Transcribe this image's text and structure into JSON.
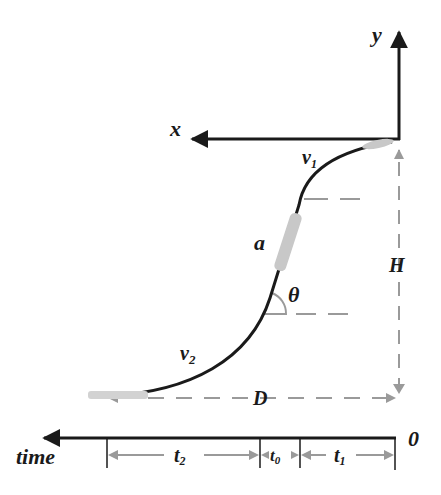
{
  "diagram": {
    "type": "motion-trajectory",
    "axes": {
      "x_label": "x",
      "y_label": "y"
    },
    "trajectory": {
      "velocity_start": {
        "base": "v",
        "sub": "1"
      },
      "velocity_end": {
        "base": "v",
        "sub": "2"
      },
      "acceleration_label": "a",
      "angle_label": "θ"
    },
    "dimensions": {
      "height_label": "H",
      "distance_label": "D"
    },
    "timeline": {
      "axis_label": "time",
      "origin_label": "0",
      "segments": [
        {
          "base": "t",
          "sub": "2"
        },
        {
          "base": "t",
          "sub": "0"
        },
        {
          "base": "t",
          "sub": "1"
        }
      ]
    },
    "colors": {
      "line": "#1a1a1a",
      "dashed": "#9a9a9a",
      "object": "#c8c8c8"
    }
  }
}
